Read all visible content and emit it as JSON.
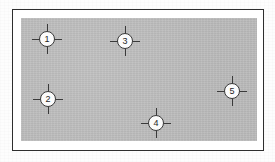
{
  "figure": {
    "kind": "survey-control-point-diagram",
    "page_background": "#fdfdfd",
    "frame": {
      "border_color": "#2e2e2e",
      "inner_margin_color": "#ffffff",
      "left": 12,
      "top": 9,
      "width": 252,
      "height": 142
    },
    "plan_area": {
      "fill_color": "#bdbdbd",
      "left": 20,
      "top": 17,
      "width": 236,
      "height": 123
    },
    "marker_style": {
      "icon": "crosshair-circle-icon",
      "disc_fill": "#fbfbfb",
      "stroke_color": "#3a3a3a",
      "label_color": "#1f1f1f",
      "disc_diameter": 16,
      "tick_length": 8
    },
    "markers": [
      {
        "label": "1",
        "x": 46,
        "y": 38
      },
      {
        "label": "2",
        "x": 47,
        "y": 98
      },
      {
        "label": "3",
        "x": 124,
        "y": 40
      },
      {
        "label": "4",
        "x": 155,
        "y": 122
      },
      {
        "label": "5",
        "x": 231,
        "y": 90
      }
    ]
  }
}
